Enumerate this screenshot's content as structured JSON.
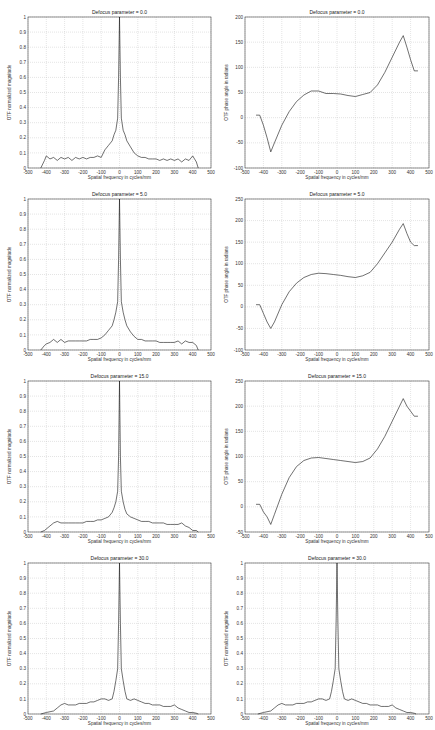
{
  "chart_data": [
    {
      "id": "mag_0",
      "type": "line",
      "title": "Defocus parameter = 0.0",
      "xlabel": "Spatial frequency in cycles/mm",
      "ylabel": "OTF normalized magnitude",
      "xlim": [
        -500,
        500
      ],
      "ylim": [
        0,
        1
      ],
      "xticks": [
        -500,
        -400,
        -300,
        -200,
        -100,
        0,
        100,
        200,
        300,
        400,
        500
      ],
      "yticks": [
        0,
        0.1,
        0.2,
        0.3,
        0.4,
        0.5,
        0.6,
        0.7,
        0.8,
        0.9,
        1
      ],
      "grid": true,
      "x": [
        -430,
        -410,
        -400,
        -380,
        -360,
        -340,
        -320,
        -300,
        -280,
        -260,
        -240,
        -220,
        -200,
        -180,
        -160,
        -140,
        -120,
        -100,
        -80,
        -60,
        -40,
        -30,
        -20,
        -10,
        -5,
        0,
        5,
        10,
        20,
        30,
        40,
        60,
        80,
        100,
        120,
        140,
        160,
        180,
        200,
        220,
        240,
        260,
        280,
        300,
        320,
        340,
        360,
        380,
        400,
        420,
        430
      ],
      "values": [
        0,
        0.05,
        0.08,
        0.06,
        0.07,
        0.05,
        0.07,
        0.06,
        0.07,
        0.05,
        0.07,
        0.06,
        0.07,
        0.06,
        0.07,
        0.07,
        0.08,
        0.07,
        0.12,
        0.15,
        0.18,
        0.22,
        0.25,
        0.33,
        0.6,
        1.0,
        0.6,
        0.33,
        0.25,
        0.22,
        0.18,
        0.14,
        0.1,
        0.08,
        0.07,
        0.07,
        0.06,
        0.06,
        0.06,
        0.05,
        0.06,
        0.05,
        0.06,
        0.05,
        0.06,
        0.04,
        0.06,
        0.05,
        0.08,
        0.04,
        0
      ]
    },
    {
      "id": "phase_0",
      "type": "line",
      "title": "Defocus parameter = 0.0",
      "xlabel": "Spatial frequency in cycles/mm",
      "ylabel": "OTF phase angle in radians",
      "xlim": [
        -500,
        500
      ],
      "ylim": [
        -100,
        200
      ],
      "xticks": [
        -500,
        -400,
        -300,
        -200,
        -100,
        0,
        100,
        200,
        300,
        400,
        500
      ],
      "yticks": [
        -100,
        -50,
        0,
        50,
        100,
        150,
        200
      ],
      "grid": true,
      "x": [
        -440,
        -420,
        -400,
        -380,
        -360,
        -340,
        -300,
        -260,
        -220,
        -180,
        -140,
        -100,
        -60,
        -20,
        20,
        60,
        100,
        140,
        180,
        220,
        260,
        300,
        340,
        360,
        380,
        400,
        420,
        440
      ],
      "values": [
        5,
        5,
        -15,
        -40,
        -68,
        -50,
        -15,
        12,
        32,
        45,
        53,
        53,
        48,
        48,
        47,
        44,
        42,
        46,
        50,
        65,
        90,
        120,
        150,
        163,
        140,
        115,
        93,
        93
      ]
    },
    {
      "id": "mag_5",
      "type": "line",
      "title": "Defocus parameter = 5.0",
      "xlabel": "Spatial frequency in cycles/mm",
      "ylabel": "OTF normalized magnitude",
      "xlim": [
        -500,
        500
      ],
      "ylim": [
        0,
        1
      ],
      "xticks": [
        -500,
        -400,
        -300,
        -200,
        -100,
        0,
        100,
        200,
        300,
        400,
        500
      ],
      "yticks": [
        0,
        0.1,
        0.2,
        0.3,
        0.4,
        0.5,
        0.6,
        0.7,
        0.8,
        0.9,
        1
      ],
      "grid": true,
      "x": [
        -430,
        -410,
        -400,
        -380,
        -360,
        -340,
        -320,
        -300,
        -280,
        -260,
        -240,
        -220,
        -200,
        -180,
        -160,
        -140,
        -120,
        -100,
        -80,
        -60,
        -40,
        -30,
        -20,
        -10,
        -5,
        0,
        5,
        10,
        20,
        30,
        40,
        60,
        80,
        100,
        120,
        140,
        160,
        180,
        200,
        220,
        240,
        260,
        280,
        300,
        320,
        340,
        360,
        380,
        400,
        420,
        430
      ],
      "values": [
        0,
        0.03,
        0.04,
        0.05,
        0.07,
        0.05,
        0.07,
        0.05,
        0.06,
        0.06,
        0.06,
        0.06,
        0.06,
        0.06,
        0.07,
        0.07,
        0.07,
        0.08,
        0.1,
        0.13,
        0.16,
        0.2,
        0.25,
        0.32,
        0.6,
        1.0,
        0.6,
        0.32,
        0.25,
        0.2,
        0.16,
        0.12,
        0.09,
        0.07,
        0.07,
        0.06,
        0.06,
        0.06,
        0.06,
        0.05,
        0.05,
        0.05,
        0.05,
        0.05,
        0.06,
        0.04,
        0.06,
        0.05,
        0.05,
        0.03,
        0
      ]
    },
    {
      "id": "phase_5",
      "type": "line",
      "title": "Defocus parameter = 5.0",
      "xlabel": "Spatial frequency in cycles/mm",
      "ylabel": "OTF phase angle in radians",
      "xlim": [
        -500,
        500
      ],
      "ylim": [
        -100,
        250
      ],
      "xticks": [
        -500,
        -400,
        -300,
        -200,
        -100,
        0,
        100,
        200,
        300,
        400,
        500
      ],
      "yticks": [
        -100,
        -50,
        0,
        50,
        100,
        150,
        200,
        250
      ],
      "grid": true,
      "x": [
        -440,
        -420,
        -400,
        -380,
        -360,
        -340,
        -300,
        -260,
        -220,
        -180,
        -140,
        -100,
        -60,
        -20,
        20,
        60,
        100,
        140,
        180,
        220,
        260,
        300,
        340,
        360,
        380,
        400,
        420,
        440
      ],
      "values": [
        5,
        5,
        -15,
        -35,
        -50,
        -35,
        5,
        35,
        55,
        68,
        75,
        78,
        77,
        75,
        73,
        70,
        68,
        72,
        80,
        100,
        125,
        150,
        180,
        193,
        170,
        150,
        142,
        142
      ]
    },
    {
      "id": "mag_15",
      "type": "line",
      "title": "Defocus parameter = 15.0",
      "xlabel": "Spatial frequency in cycles/mm",
      "ylabel": "OTF normalized magnitude",
      "xlim": [
        -500,
        500
      ],
      "ylim": [
        0,
        1
      ],
      "xticks": [
        -500,
        -400,
        -300,
        -200,
        -100,
        0,
        100,
        200,
        300,
        400,
        500
      ],
      "yticks": [
        0,
        0.1,
        0.2,
        0.3,
        0.4,
        0.5,
        0.6,
        0.7,
        0.8,
        0.9,
        1
      ],
      "grid": true,
      "x": [
        -430,
        -410,
        -380,
        -360,
        -340,
        -320,
        -300,
        -280,
        -260,
        -240,
        -220,
        -200,
        -180,
        -160,
        -140,
        -120,
        -100,
        -80,
        -60,
        -40,
        -30,
        -20,
        -10,
        -5,
        0,
        5,
        10,
        20,
        30,
        40,
        60,
        80,
        100,
        120,
        140,
        160,
        180,
        200,
        220,
        240,
        260,
        280,
        300,
        320,
        340,
        360,
        380,
        400,
        420,
        430
      ],
      "values": [
        0,
        0.01,
        0.04,
        0.06,
        0.07,
        0.06,
        0.06,
        0.06,
        0.06,
        0.06,
        0.06,
        0.06,
        0.07,
        0.07,
        0.07,
        0.08,
        0.08,
        0.09,
        0.1,
        0.13,
        0.16,
        0.2,
        0.27,
        0.5,
        1.0,
        0.5,
        0.27,
        0.2,
        0.15,
        0.12,
        0.1,
        0.09,
        0.08,
        0.07,
        0.07,
        0.07,
        0.06,
        0.06,
        0.06,
        0.06,
        0.05,
        0.05,
        0.05,
        0.05,
        0.06,
        0.04,
        0.03,
        0.01,
        0.01,
        0
      ]
    },
    {
      "id": "phase_15",
      "type": "line",
      "title": "Defocus parameter = 15.0",
      "xlabel": "Spatial frequency in cycles/mm",
      "ylabel": "OTF phase angle in radians",
      "xlim": [
        -500,
        500
      ],
      "ylim": [
        -50,
        250
      ],
      "xticks": [
        -500,
        -400,
        -300,
        -200,
        -100,
        0,
        100,
        200,
        300,
        400,
        500
      ],
      "yticks": [
        -50,
        0,
        50,
        100,
        150,
        200,
        250
      ],
      "grid": true,
      "x": [
        -440,
        -420,
        -400,
        -380,
        -360,
        -340,
        -300,
        -260,
        -220,
        -180,
        -140,
        -100,
        -60,
        -20,
        20,
        60,
        100,
        140,
        180,
        220,
        260,
        300,
        340,
        360,
        380,
        400,
        420,
        440
      ],
      "values": [
        5,
        5,
        -10,
        -20,
        -35,
        -15,
        25,
        58,
        80,
        92,
        97,
        98,
        96,
        94,
        92,
        90,
        88,
        90,
        97,
        115,
        140,
        170,
        200,
        215,
        200,
        190,
        180,
        180
      ]
    },
    {
      "id": "mag_30_a",
      "type": "line",
      "title": "Defocus parameter = 30.0",
      "xlabel": "Spatial frequency in cycles/mm",
      "ylabel": "OTF normalized magnitude",
      "xlim": [
        -500,
        500
      ],
      "ylim": [
        0,
        1
      ],
      "xticks": [
        -500,
        -400,
        -300,
        -200,
        -100,
        0,
        100,
        200,
        300,
        400,
        500
      ],
      "yticks": [
        0,
        0.1,
        0.2,
        0.3,
        0.4,
        0.5,
        0.6,
        0.7,
        0.8,
        0.9,
        1
      ],
      "grid": true,
      "x": [
        -430,
        -400,
        -360,
        -340,
        -320,
        -300,
        -280,
        -260,
        -240,
        -220,
        -200,
        -180,
        -160,
        -140,
        -120,
        -100,
        -80,
        -60,
        -40,
        -30,
        -20,
        -10,
        -5,
        0,
        5,
        10,
        20,
        30,
        40,
        60,
        80,
        100,
        120,
        140,
        160,
        180,
        200,
        220,
        240,
        260,
        280,
        300,
        320,
        340,
        360,
        380,
        400,
        420,
        430
      ],
      "values": [
        0,
        0.01,
        0.02,
        0.04,
        0.06,
        0.07,
        0.06,
        0.06,
        0.06,
        0.07,
        0.07,
        0.07,
        0.08,
        0.08,
        0.09,
        0.1,
        0.1,
        0.09,
        0.1,
        0.15,
        0.22,
        0.3,
        0.6,
        1.0,
        0.6,
        0.3,
        0.22,
        0.15,
        0.1,
        0.09,
        0.1,
        0.09,
        0.08,
        0.07,
        0.07,
        0.06,
        0.06,
        0.06,
        0.05,
        0.05,
        0.05,
        0.06,
        0.04,
        0.03,
        0.02,
        0.01,
        0.01,
        0.005,
        0
      ]
    },
    {
      "id": "mag_30_b",
      "type": "line",
      "title": "Defocus parameter = 30.0",
      "xlabel": "Spatial frequency in cycles/mm",
      "ylabel": "OTF normalized magnitude",
      "xlim": [
        -500,
        500
      ],
      "ylim": [
        0,
        1
      ],
      "xticks": [
        -500,
        -400,
        -300,
        -200,
        -100,
        0,
        100,
        200,
        300,
        400,
        500
      ],
      "yticks": [
        0,
        0.1,
        0.2,
        0.3,
        0.4,
        0.5,
        0.6,
        0.7,
        0.8,
        0.9,
        1
      ],
      "grid": true,
      "x": [
        -430,
        -400,
        -360,
        -340,
        -320,
        -300,
        -280,
        -260,
        -240,
        -220,
        -200,
        -180,
        -160,
        -140,
        -120,
        -100,
        -80,
        -60,
        -40,
        -30,
        -20,
        -10,
        -5,
        0,
        5,
        10,
        20,
        30,
        40,
        60,
        80,
        100,
        120,
        140,
        160,
        180,
        200,
        220,
        240,
        260,
        280,
        300,
        320,
        340,
        360,
        380,
        400,
        420,
        430
      ],
      "values": [
        0,
        0.01,
        0.02,
        0.04,
        0.06,
        0.07,
        0.06,
        0.06,
        0.06,
        0.07,
        0.07,
        0.07,
        0.08,
        0.08,
        0.09,
        0.1,
        0.1,
        0.09,
        0.1,
        0.15,
        0.22,
        0.3,
        0.6,
        1.0,
        0.6,
        0.3,
        0.22,
        0.15,
        0.1,
        0.09,
        0.1,
        0.09,
        0.08,
        0.07,
        0.07,
        0.06,
        0.06,
        0.06,
        0.05,
        0.05,
        0.05,
        0.06,
        0.04,
        0.03,
        0.02,
        0.01,
        0.01,
        0.005,
        0
      ]
    }
  ],
  "layout": {
    "panels": [
      {
        "chart": 0,
        "left": 0,
        "top": 0,
        "w": 217,
        "h": 182
      },
      {
        "chart": 1,
        "left": 217,
        "top": 0,
        "w": 218,
        "h": 182
      },
      {
        "chart": 2,
        "left": 0,
        "top": 182,
        "w": 217,
        "h": 182
      },
      {
        "chart": 3,
        "left": 217,
        "top": 182,
        "w": 218,
        "h": 182
      },
      {
        "chart": 4,
        "left": 0,
        "top": 364,
        "w": 217,
        "h": 182
      },
      {
        "chart": 5,
        "left": 217,
        "top": 364,
        "w": 218,
        "h": 182
      },
      {
        "chart": 6,
        "left": 0,
        "top": 546,
        "w": 217,
        "h": 182
      },
      {
        "chart": 7,
        "left": 217,
        "top": 546,
        "w": 218,
        "h": 182
      }
    ]
  }
}
